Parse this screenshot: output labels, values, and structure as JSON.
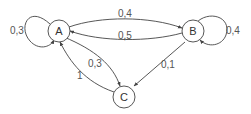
{
  "diagram": {
    "type": "markov-chain",
    "nodes": [
      {
        "id": "A",
        "label": "A"
      },
      {
        "id": "B",
        "label": "B"
      },
      {
        "id": "C",
        "label": "C"
      }
    ],
    "edges": [
      {
        "from": "A",
        "to": "A",
        "label": "0,3"
      },
      {
        "from": "A",
        "to": "B",
        "label": "0,4"
      },
      {
        "from": "B",
        "to": "A",
        "label": "0,5"
      },
      {
        "from": "B",
        "to": "B",
        "label": "0,4"
      },
      {
        "from": "A",
        "to": "C",
        "label": "0,3"
      },
      {
        "from": "B",
        "to": "C",
        "label": "0,1"
      },
      {
        "from": "C",
        "to": "A",
        "label": "1"
      }
    ]
  }
}
